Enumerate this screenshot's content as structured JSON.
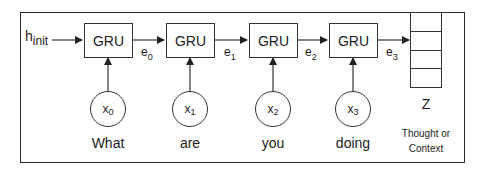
{
  "diagram": {
    "type": "GRU encoder (sequence to thought vector)",
    "initial_state": {
      "base": "h",
      "subscript": "init"
    },
    "cells": [
      {
        "label": "GRU",
        "input": {
          "base": "x",
          "subscript": "0"
        },
        "word": "What",
        "output": {
          "base": "e",
          "subscript": "0"
        }
      },
      {
        "label": "GRU",
        "input": {
          "base": "x",
          "subscript": "1"
        },
        "word": "are",
        "output": {
          "base": "e",
          "subscript": "1"
        }
      },
      {
        "label": "GRU",
        "input": {
          "base": "x",
          "subscript": "2"
        },
        "word": "you",
        "output": {
          "base": "e",
          "subscript": "2"
        }
      },
      {
        "label": "GRU",
        "input": {
          "base": "x",
          "subscript": "3"
        },
        "word": "doing",
        "output": {
          "base": "e",
          "subscript": "3"
        }
      }
    ],
    "context_vector": {
      "label": "Z",
      "cells": 4,
      "caption_line1": "Thought or",
      "caption_line2": "Context"
    },
    "colors": {
      "stroke": "#333333",
      "background": "#ffffff",
      "text": "#222222"
    }
  }
}
